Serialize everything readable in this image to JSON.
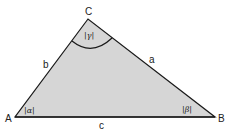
{
  "diagram": {
    "colors": {
      "fill": "#d6d6d6",
      "stroke": "#1a1a1a",
      "background": "#ffffff"
    },
    "vertices": {
      "A": {
        "label": "A",
        "x": 15,
        "y": 117
      },
      "B": {
        "label": "B",
        "x": 215,
        "y": 117
      },
      "C": {
        "label": "C",
        "x": 88,
        "y": 19
      }
    },
    "sides": {
      "a": {
        "label": "a",
        "from": "B",
        "to": "C"
      },
      "b": {
        "label": "b",
        "from": "A",
        "to": "C"
      },
      "c": {
        "label": "c",
        "from": "A",
        "to": "B"
      }
    },
    "angles": {
      "alpha": {
        "label": "|α|",
        "vertex": "A"
      },
      "beta": {
        "label": "|β|",
        "vertex": "B"
      },
      "gamma": {
        "label": "|γ|",
        "vertex": "C",
        "arc": true
      }
    }
  }
}
